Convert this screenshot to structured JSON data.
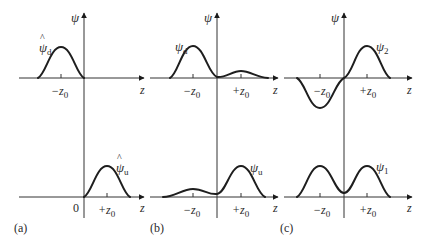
{
  "figure": {
    "panels": [
      {
        "id": "a",
        "label": "(a)",
        "y_axis_label": "ψ",
        "top": {
          "curve_label_main": "ψ",
          "curve_label_hat": "^",
          "curve_label_sub": "d",
          "tick_label": "−z",
          "tick_label_sub": "0",
          "x_axis_label": "z"
        },
        "bottom": {
          "curve_label_main": "ψ",
          "curve_label_hat": "^",
          "curve_label_sub": "u",
          "origin_label": "0",
          "tick_label": "+z",
          "tick_label_sub": "0",
          "x_axis_label": "z"
        }
      },
      {
        "id": "b",
        "label": "(b)",
        "y_axis_label": "ψ",
        "top": {
          "curve_label_main": "ψ",
          "curve_label_sub": "d",
          "tick_left": "−z",
          "tick_left_sub": "0",
          "tick_right": "+z",
          "tick_right_sub": "0",
          "x_axis_label": "z"
        },
        "bottom": {
          "curve_label_main": "ψ",
          "curve_label_sub": "u",
          "tick_left": "−z",
          "tick_left_sub": "0",
          "tick_right": "+z",
          "tick_right_sub": "0",
          "x_axis_label": "z"
        }
      },
      {
        "id": "c",
        "label": "(c)",
        "y_axis_label": "ψ",
        "top": {
          "curve_label_main": "ψ",
          "curve_label_sub": "2",
          "tick_left": "−z",
          "tick_left_sub": "0",
          "tick_right": "+z",
          "tick_right_sub": "0",
          "x_axis_label": "z"
        },
        "bottom": {
          "curve_label_main": "ψ",
          "curve_label_sub": "1",
          "tick_left": "−z",
          "tick_left_sub": "0",
          "tick_right": "+z",
          "tick_right_sub": "0",
          "x_axis_label": "z"
        }
      }
    ]
  }
}
